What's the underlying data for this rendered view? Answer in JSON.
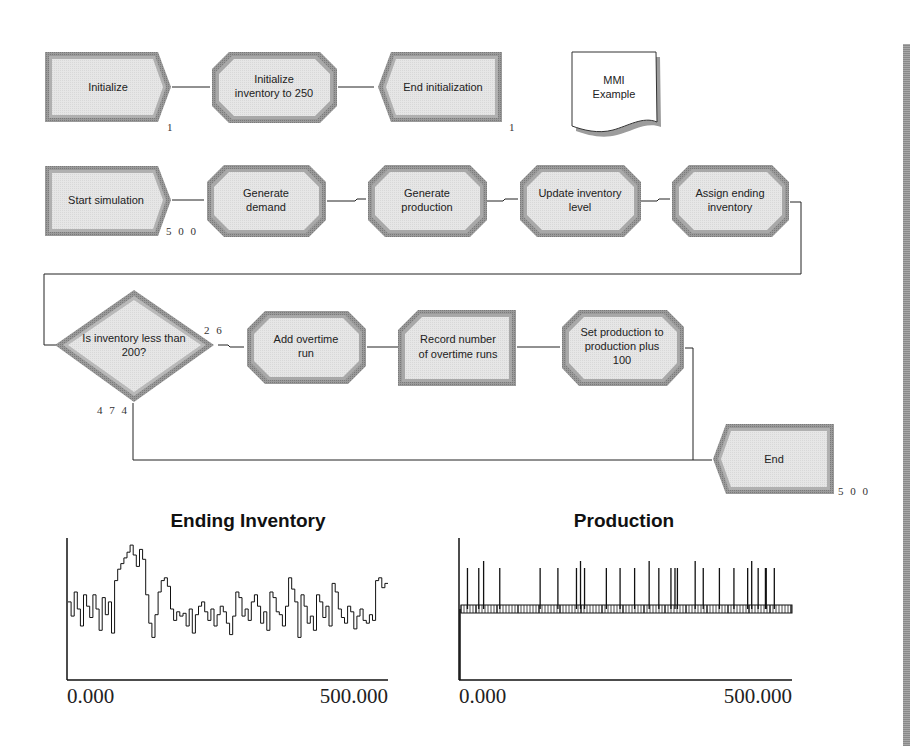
{
  "diagram": {
    "modules": [
      {
        "id": "initialize",
        "type": "create",
        "label_lines": [
          "Initialize"
        ],
        "count": "1"
      },
      {
        "id": "init-inventory",
        "type": "assign",
        "label_lines": [
          "Initialize",
          "inventory to 250"
        ]
      },
      {
        "id": "end-init",
        "type": "dispose",
        "label_lines": [
          "End initialization"
        ],
        "count": "1"
      },
      {
        "id": "note",
        "type": "note",
        "label_lines": [
          "MMI",
          "Example"
        ]
      },
      {
        "id": "start-simulation",
        "type": "create",
        "label_lines": [
          "Start simulation"
        ],
        "count": "5 0 0"
      },
      {
        "id": "generate-demand",
        "type": "assign",
        "label_lines": [
          "Generate",
          "demand"
        ]
      },
      {
        "id": "generate-production",
        "type": "assign",
        "label_lines": [
          "Generate",
          "production"
        ]
      },
      {
        "id": "update-inventory",
        "type": "assign",
        "label_lines": [
          "Update inventory",
          "level"
        ]
      },
      {
        "id": "assign-ending",
        "type": "assign",
        "label_lines": [
          "Assign ending",
          "inventory"
        ]
      },
      {
        "id": "decide",
        "type": "decide",
        "label_lines": [
          "Is inventory less than",
          "200?"
        ],
        "true_count": "2 6",
        "false_count": "4 7 4"
      },
      {
        "id": "add-overtime",
        "type": "assign",
        "label_lines": [
          "Add overtime",
          "run"
        ]
      },
      {
        "id": "record-overtime",
        "type": "record",
        "label_lines": [
          "Record number",
          "of overtime runs"
        ]
      },
      {
        "id": "set-production",
        "type": "assign",
        "label_lines": [
          "Set production to",
          "production plus",
          "100"
        ]
      },
      {
        "id": "end",
        "type": "dispose",
        "label_lines": [
          "End"
        ],
        "count": "5 0 0"
      }
    ]
  },
  "chart_data": [
    {
      "type": "line",
      "title": "Ending Inventory",
      "xlabel": "",
      "ylabel": "",
      "xlim": [
        0,
        500
      ],
      "x_tick_labels": [
        "0.000",
        "500.000"
      ],
      "grid": false,
      "series": [
        {
          "name": "Ending Inventory",
          "description": "step plot fluctuating around mid-level with an early peak near x≈50-70",
          "values": [
            0.55,
            0.45,
            0.62,
            0.5,
            0.38,
            0.6,
            0.52,
            0.44,
            0.6,
            0.5,
            0.35,
            0.58,
            0.46,
            0.55,
            0.33,
            0.7,
            0.78,
            0.82,
            0.86,
            0.9,
            0.95,
            0.88,
            0.8,
            0.92,
            0.85,
            0.6,
            0.4,
            0.3,
            0.46,
            0.62,
            0.7,
            0.72,
            0.66,
            0.5,
            0.42,
            0.48,
            0.45,
            0.47,
            0.38,
            0.5,
            0.33,
            0.46,
            0.52,
            0.55,
            0.48,
            0.42,
            0.5,
            0.38,
            0.46,
            0.52,
            0.48,
            0.4,
            0.32,
            0.45,
            0.62,
            0.58,
            0.45,
            0.5,
            0.42,
            0.55,
            0.6,
            0.52,
            0.4,
            0.48,
            0.35,
            0.62,
            0.58,
            0.48,
            0.46,
            0.38,
            0.52,
            0.72,
            0.64,
            0.55,
            0.3,
            0.6,
            0.52,
            0.4,
            0.45,
            0.35,
            0.6,
            0.55,
            0.44,
            0.52,
            0.38,
            0.68,
            0.62,
            0.5,
            0.44,
            0.4,
            0.52,
            0.48,
            0.36,
            0.45,
            0.5,
            0.42,
            0.4,
            0.46,
            0.42,
            0.7,
            0.72,
            0.65,
            0.68
          ]
        }
      ]
    },
    {
      "type": "line",
      "title": "Production",
      "xlabel": "",
      "ylabel": "",
      "xlim": [
        0,
        500
      ],
      "x_tick_labels": [
        "0.000",
        "500.000"
      ],
      "grid": false,
      "series": [
        {
          "name": "Production",
          "description": "baseline near mid-height with narrow spikes up (overtime +100)",
          "baseline": 0.5,
          "spike_positions": [
            8,
            22,
            28,
            48,
            98,
            120,
            143,
            148,
            153,
            180,
            197,
            215,
            233,
            245,
            260,
            265,
            268,
            290,
            300,
            320,
            338,
            355,
            360,
            368,
            377,
            378,
            388
          ]
        }
      ]
    }
  ]
}
